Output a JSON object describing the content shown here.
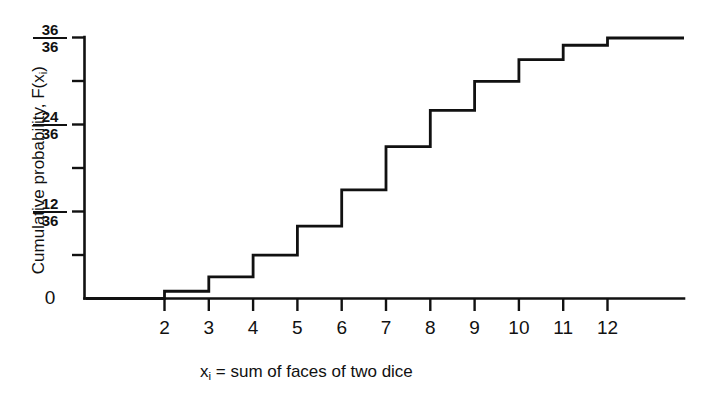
{
  "chart_data": {
    "type": "line",
    "subtype": "step-cdf",
    "title": "",
    "xlabel": "xᵢ = sum of faces of two dice",
    "xlabel_parts": {
      "prefix": "x",
      "subscript": "i",
      "rest": " = sum of faces of two dice"
    },
    "ylabel": "Cumulative probability, F(xᵢ)",
    "ylabel_parts": {
      "prefix": "Cumulative probability, F(x",
      "subscript": "i",
      "rest": ")"
    },
    "x": [
      2,
      3,
      4,
      5,
      6,
      7,
      8,
      9,
      10,
      11,
      12
    ],
    "values": [
      0.027777777777777776,
      0.08333333333333333,
      0.16666666666666666,
      0.2777777777777778,
      0.4166666666666667,
      0.5833333333333334,
      0.7222222222222222,
      0.8333333333333334,
      0.9166666666666666,
      0.9722222222222222,
      1.0
    ],
    "numerators": [
      1,
      3,
      6,
      10,
      15,
      21,
      26,
      30,
      33,
      35,
      36
    ],
    "denominator": 36,
    "xlim": [
      1.15,
      13.6
    ],
    "ylim": [
      0,
      1
    ],
    "grid": false,
    "legend": null,
    "xticks": [
      2,
      3,
      4,
      5,
      6,
      7,
      8,
      9,
      10,
      11,
      12
    ],
    "xtick_labels": [
      "2",
      "3",
      "4",
      "5",
      "6",
      "7",
      "8",
      "9",
      "10",
      "11",
      "12"
    ],
    "yticks": [
      0,
      0.16666666666666666,
      0.3333333333333333,
      0.5,
      0.6666666666666666,
      0.8333333333333334,
      1.0
    ],
    "ytick_labels": [
      "0",
      "",
      "12/36",
      "",
      "24/36",
      "",
      "36/36"
    ],
    "ytick_labeled": [
      {
        "value": 0,
        "numerator": null,
        "denominator": null,
        "text": "0"
      },
      {
        "value": 0.3333333333333333,
        "numerator": "12",
        "denominator": "36",
        "text": "12/36"
      },
      {
        "value": 0.6666666666666666,
        "numerator": "24",
        "denominator": "36",
        "text": "24/36"
      },
      {
        "value": 1.0,
        "numerator": "36",
        "denominator": "36",
        "text": "36/36"
      }
    ],
    "line_color": "#111111",
    "background_color": "#ffffff"
  },
  "axis": {
    "y_title": "Cumulative probability, F(x",
    "y_title_sub": "i",
    "y_title_end": ")",
    "x_title": "x",
    "x_title_sub": "i",
    "x_title_end": " = sum of faces of two dice"
  },
  "labels": {
    "y_36_num": "36",
    "y_36_den": "36",
    "y_24_num": "24",
    "y_24_den": "36",
    "y_12_num": "12",
    "y_12_den": "36",
    "y_0": "0",
    "x_2": "2",
    "x_3": "3",
    "x_4": "4",
    "x_5": "5",
    "x_6": "6",
    "x_7": "7",
    "x_8": "8",
    "x_9": "9",
    "x_10": "10",
    "x_11": "11",
    "x_12": "12"
  }
}
